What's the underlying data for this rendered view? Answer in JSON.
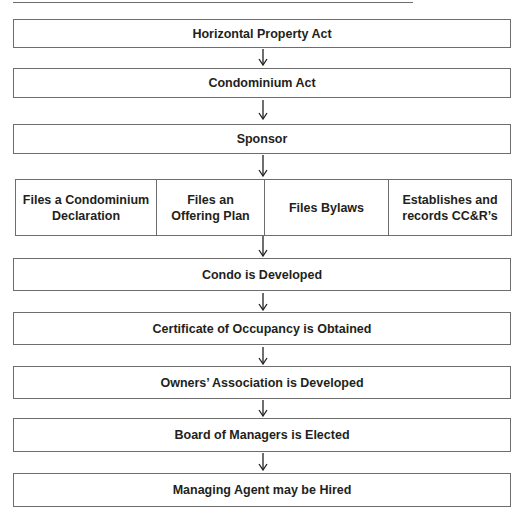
{
  "diagram": {
    "type": "flowchart",
    "direction": "top-to-bottom",
    "steps": [
      {
        "label": "Horizontal Property Act"
      },
      {
        "label": "Condominium Act"
      },
      {
        "label": "Sponsor"
      },
      {
        "label": "Condo is Developed"
      },
      {
        "label": "Certificate of Occupancy is Obtained"
      },
      {
        "label": "Owners’ Association is Developed"
      },
      {
        "label": "Board of Managers is Elected"
      },
      {
        "label": "Managing Agent may be Hired"
      }
    ],
    "sponsor_actions": [
      {
        "label": "Files a Condominium Declaration"
      },
      {
        "label": "Files an Offering Plan"
      },
      {
        "label": "Files Bylaws"
      },
      {
        "label": "Establishes and records CC&R’s"
      }
    ],
    "colors": {
      "border": "#6d6d6d",
      "text": "#231f20",
      "background": "#ffffff"
    }
  }
}
